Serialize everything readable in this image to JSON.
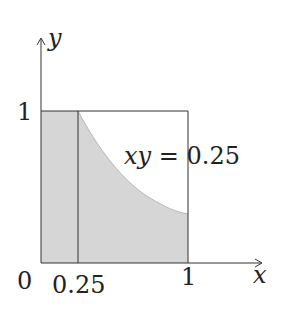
{
  "diagram": {
    "axes": {
      "x_label": "x",
      "y_label": "y",
      "origin_label": "0"
    },
    "ticks": {
      "x": [
        "0.25",
        "1"
      ],
      "y": [
        "1"
      ]
    },
    "curve": {
      "equation_lhs": "xy",
      "equation_eq": "=",
      "equation_rhs": "0.25",
      "function": "y = 0.25 / x",
      "x_range": [
        0.25,
        1
      ]
    },
    "shaded_region": "Area under min(1, 0.25/x) over [0,1]",
    "unit_square": true,
    "colors": {
      "shade": "#d6d6d6",
      "line": "#333333",
      "background": "#ffffff"
    }
  }
}
